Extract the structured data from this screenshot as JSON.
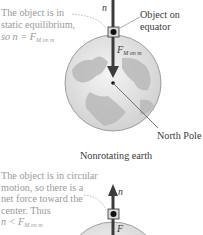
{
  "panel_top": {
    "caption": "Nonrotating earth",
    "left_note": {
      "line1": "The object is in",
      "line2": "static equilibrium,",
      "line3_prefix": "so n = F",
      "line3_sub": "M on m"
    },
    "right_label": {
      "line1": "Object on",
      "line2": "equator"
    },
    "pole_label": "North Pole",
    "vector_n": "n",
    "vector_F": "F",
    "vector_F_sub": "M on m"
  },
  "panel_bottom": {
    "left_note": {
      "line1": "The object is in circular",
      "line2": "motion, so there is a",
      "line3": "net force toward the",
      "line4": "center. Thus",
      "line5_prefix": "n < F",
      "line5_sub": "M on m"
    },
    "vector_n": "n",
    "vector_F": "F"
  },
  "colors": {
    "arrow": "#3c3c3c",
    "globe_fill": "#dcdcdc",
    "land": "#bdbdbd",
    "note_text": "#9a9a9a",
    "label_text": "#3a3a3a"
  }
}
